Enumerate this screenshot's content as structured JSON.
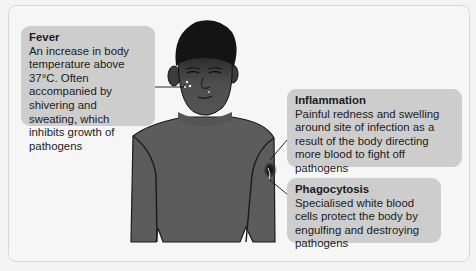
{
  "diagram": {
    "labels": [
      {
        "id": "fever",
        "title": "Fever",
        "text": "An increase in body temperature above 37°C. Often accompanied by shivering and sweating, which inhibits growth of pathogens"
      },
      {
        "id": "inflammation",
        "title": "Inflammation",
        "text": "Painful redness and swelling around site of infection as a result of the body directing more blood to fight off pathogens"
      },
      {
        "id": "phagocytosis",
        "title": "Phagocytosis",
        "text": "Specialised white blood cells protect the body by engulfing and destroying pathogens"
      }
    ],
    "colors": {
      "background": "#f6f6f6",
      "label_box": "#cdcdcd",
      "text": "#1b1b1b",
      "shirt": "#5a5a5a",
      "skin": "#4a4a4a",
      "hair": "#141414"
    }
  }
}
